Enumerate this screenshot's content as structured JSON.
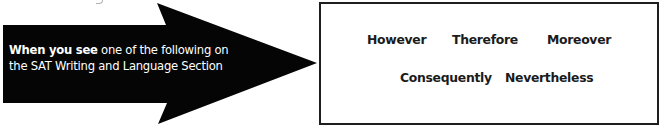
{
  "arrow": {
    "color": "#050505",
    "text_lead": "When you see",
    "text_rest_line1": " one of the following on",
    "text_line2": "the SAT Writing and Language Section",
    "shape_points": "3,25 166,25 157,3 317,63 158,124 167,103 3,103"
  },
  "word_box": {
    "border_color": "#1e1e1e",
    "row1": [
      "However",
      "Therefore",
      "Moreover"
    ],
    "row2": [
      "Consequently",
      "Nevertheless"
    ]
  }
}
